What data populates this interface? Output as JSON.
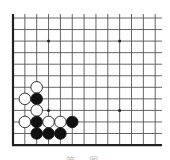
{
  "diagram": {
    "type": "go-board-fragment",
    "corner": "bottom-left",
    "grid": {
      "columns": 13,
      "rows": 12,
      "origin_x": 13,
      "origin_y": 18,
      "spacing_x": 11.85,
      "spacing_y": 11.55,
      "right_extent": 162,
      "top_extent": 14
    },
    "colors": {
      "black": "#111111",
      "white": "#ffffff",
      "line": "#555555",
      "edge": "#222222"
    },
    "hoshi": [
      {
        "col": 3,
        "row": 2
      },
      {
        "col": 9,
        "row": 2
      },
      {
        "col": 3,
        "row": 8
      },
      {
        "col": 9,
        "row": 8
      }
    ],
    "stones": [
      {
        "color": "white",
        "col": 2,
        "row": 6
      },
      {
        "color": "white",
        "col": 1,
        "row": 7
      },
      {
        "color": "black",
        "col": 2,
        "row": 7
      },
      {
        "color": "white",
        "col": 2,
        "row": 8
      },
      {
        "color": "white",
        "col": 1,
        "row": 9
      },
      {
        "color": "black",
        "col": 2,
        "row": 9
      },
      {
        "color": "white",
        "col": 3,
        "row": 9
      },
      {
        "color": "white",
        "col": 4,
        "row": 9
      },
      {
        "color": "black",
        "col": 5,
        "row": 9
      },
      {
        "color": "black",
        "col": 2,
        "row": 10
      },
      {
        "color": "black",
        "col": 3,
        "row": 10
      },
      {
        "color": "black",
        "col": 4,
        "row": 10
      }
    ],
    "caption": "第 图"
  }
}
